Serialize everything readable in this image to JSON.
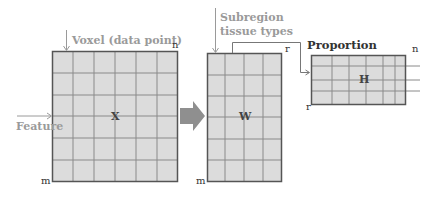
{
  "diagram": {
    "type": "matrix-factorization",
    "colors": {
      "cell_fill": "#dcdcdc",
      "grid_line": "#8a8a8a",
      "border": "#555555",
      "arrow_fill": "#8f8f8f",
      "annotation_grey": "#9a9a9a",
      "dimension_text": "#333333"
    },
    "matrices": {
      "x": {
        "name": "X",
        "rows_label": "m",
        "cols_label": "n",
        "grid_cols": 6,
        "grid_rows": 6
      },
      "w": {
        "name": "W",
        "rows_label": "m",
        "cols_label": "r",
        "grid_cols": 4,
        "grid_rows": 6
      },
      "h": {
        "name": "H",
        "rows_label": "r",
        "cols_label": "n",
        "grid_cols": 6,
        "grid_rows": 4
      }
    },
    "annotations": {
      "voxel": "Voxel (data point)",
      "feature": "Feature",
      "subregion_line1": "Subregion",
      "subregion_line2": "tissue types",
      "proportion": "Proportion"
    }
  }
}
